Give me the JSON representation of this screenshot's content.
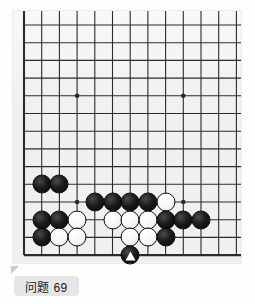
{
  "board": {
    "name": "go-board",
    "type": "go-position-diagram",
    "background_color": "#f0f0ee",
    "line_color": "#2b2b2b",
    "columns_visible": 13,
    "rows_visible": 14,
    "origin_x": 11,
    "origin_y": 14,
    "spacing": 17.7,
    "left_edge_is_board_edge": true,
    "bottom_edge_is_board_edge": true,
    "right_edge_cropped": true,
    "top_edge_cropped": true,
    "star_points": [
      {
        "col": 3,
        "row": 4
      },
      {
        "col": 9,
        "row": 4
      },
      {
        "col": 3,
        "row": 10
      },
      {
        "col": 9,
        "row": 10
      }
    ],
    "stones": [
      {
        "col": 1,
        "row": 9,
        "color": "black"
      },
      {
        "col": 2,
        "row": 9,
        "color": "black"
      },
      {
        "col": 4,
        "row": 10,
        "color": "black"
      },
      {
        "col": 5,
        "row": 10,
        "color": "black"
      },
      {
        "col": 6,
        "row": 10,
        "color": "black"
      },
      {
        "col": 7,
        "row": 10,
        "color": "black"
      },
      {
        "col": 8,
        "row": 10,
        "color": "white"
      },
      {
        "col": 1,
        "row": 11,
        "color": "black"
      },
      {
        "col": 2,
        "row": 11,
        "color": "black"
      },
      {
        "col": 3,
        "row": 11,
        "color": "white"
      },
      {
        "col": 5,
        "row": 11,
        "color": "white"
      },
      {
        "col": 6,
        "row": 11,
        "color": "white"
      },
      {
        "col": 7,
        "row": 11,
        "color": "white"
      },
      {
        "col": 8,
        "row": 11,
        "color": "black"
      },
      {
        "col": 9,
        "row": 11,
        "color": "black"
      },
      {
        "col": 10,
        "row": 11,
        "color": "black"
      },
      {
        "col": 1,
        "row": 12,
        "color": "black"
      },
      {
        "col": 2,
        "row": 12,
        "color": "white"
      },
      {
        "col": 3,
        "row": 12,
        "color": "white"
      },
      {
        "col": 6,
        "row": 12,
        "color": "white"
      },
      {
        "col": 7,
        "row": 12,
        "color": "white"
      },
      {
        "col": 8,
        "row": 12,
        "color": "black"
      },
      {
        "col": 6,
        "row": 13,
        "color": "black",
        "marker": "triangle",
        "marker_color": "#ffffff"
      }
    ]
  },
  "caption": {
    "label": "问题 69",
    "background_color": "#e6e6e6",
    "text_color": "#1a1a1a"
  }
}
